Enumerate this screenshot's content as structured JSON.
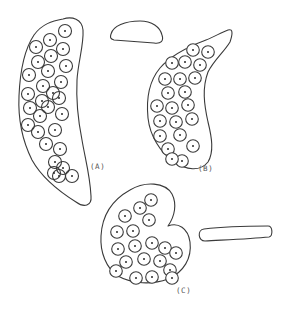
{
  "figure": {
    "panels": [
      {
        "id": "A",
        "label": "(A)",
        "description": "Elongated curved sac densely packed with many overlapping spherical cells, each with a central dot",
        "cell_packing": "overlapping"
      },
      {
        "id": "B",
        "label": "(B)",
        "description": "Banana-shaped curved sac with tapered upper-right tip containing closely packed non-overlapping spherical cells",
        "cell_packing": "close"
      },
      {
        "id": "C",
        "label": "(C)",
        "description": "Kidney-shaped rounded sac with a notch on the right side containing loosely packed spherical cells",
        "cell_packing": "loose"
      }
    ],
    "detached_shapes": [
      {
        "name": "small-dome-shape",
        "description": "Empty half-dome / lens-shaped outline"
      },
      {
        "name": "flat-rod-shape",
        "description": "Empty flat elongated rod-shaped outline"
      }
    ],
    "colors": {
      "line": "#3a3a3a",
      "nucleus": "#2a2a2a",
      "label": "#555555",
      "background": "#ffffff"
    }
  }
}
